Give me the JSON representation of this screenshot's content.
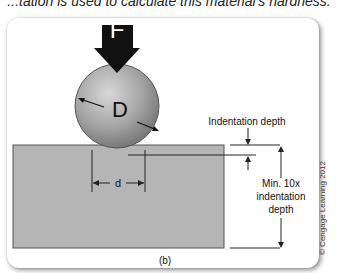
{
  "caption": "...tation is used to calculate this material's hardness.",
  "diagram": {
    "force_label": "F",
    "ball_label": "D",
    "indent_diameter_label": "d",
    "indentation_depth_label": "Indentation depth",
    "min_thickness_label_line1": "Min. 10x",
    "min_thickness_label_line2": "indentation",
    "min_thickness_label_line3": "depth",
    "panel_label": "(b)"
  },
  "copyright": "© Cengage Learning 2012",
  "colors": {
    "specimen": "#b4b4b4",
    "ball": "#a8a8a8",
    "arrow": "#111111"
  }
}
